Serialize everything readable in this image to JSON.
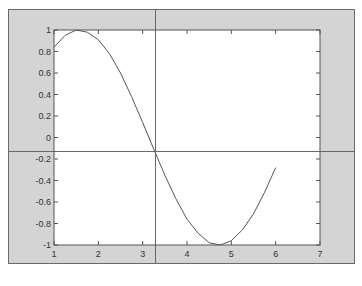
{
  "chart_data": {
    "type": "line",
    "title": "",
    "xlabel": "",
    "ylabel": "",
    "xlim": [
      1,
      7
    ],
    "ylim": [
      -1,
      1
    ],
    "grid": false,
    "legend": null,
    "x_ticks": [
      "1",
      "2",
      "3",
      "4",
      "5",
      "6",
      "7"
    ],
    "y_ticks": [
      "1",
      "0.8",
      "0.6",
      "0.4",
      "0.2",
      "0",
      "-0.2",
      "-0.4",
      "-0.6",
      "-0.8",
      "-1"
    ],
    "series": [
      {
        "name": "sin(x)",
        "x": [
          1.0,
          1.25,
          1.5,
          1.75,
          2.0,
          2.25,
          2.5,
          2.75,
          3.0,
          3.25,
          3.5,
          3.75,
          4.0,
          4.25,
          4.5,
          4.75,
          5.0,
          5.25,
          5.5,
          5.75,
          6.0
        ],
        "values": [
          0.84,
          0.95,
          1.0,
          0.98,
          0.91,
          0.78,
          0.6,
          0.38,
          0.14,
          -0.11,
          -0.35,
          -0.57,
          -0.76,
          -0.89,
          -0.98,
          -1.0,
          -0.96,
          -0.86,
          -0.71,
          -0.51,
          -0.28
        ],
        "color": "#555555"
      }
    ],
    "annotations": [
      {
        "type": "crosshair",
        "x": 3.29,
        "y": -0.13,
        "color": "#666666"
      }
    ]
  },
  "colors": {
    "figure_background": "#d4d4d4",
    "axes_background": "#ffffff",
    "axes_border": "#555555",
    "line": "#555555",
    "crosshair": "#666666",
    "frame_border": "#6a6a6a"
  }
}
